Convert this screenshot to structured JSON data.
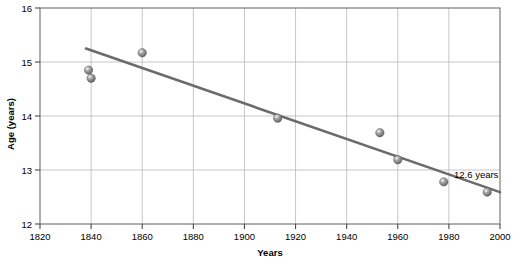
{
  "chart_data": {
    "type": "scatter",
    "title": "",
    "subtitle": "",
    "xlabel": "Years",
    "ylabel": "Age (years)",
    "xlim": [
      1820,
      2000
    ],
    "ylim": [
      12,
      16
    ],
    "xticks": [
      1820,
      1840,
      1860,
      1880,
      1900,
      1920,
      1940,
      1960,
      1980,
      2000
    ],
    "yticks": [
      12,
      13,
      14,
      15,
      16
    ],
    "xtick_labels": [
      "1820",
      "1840",
      "1860",
      "1880",
      "1900",
      "1920",
      "1940",
      "1960",
      "1980",
      "2000"
    ],
    "ytick_labels": [
      "12",
      "13",
      "14",
      "15",
      "16"
    ],
    "grid": true,
    "grid_axis": "both",
    "legend": false,
    "legend_position": "none",
    "series": [
      {
        "name": "Age at menarche",
        "type": "scatter",
        "marker": "sphere",
        "color": "#8a8a8a",
        "points": [
          {
            "x": 1839,
            "y": 14.85
          },
          {
            "x": 1840,
            "y": 14.7
          },
          {
            "x": 1860,
            "y": 15.17
          },
          {
            "x": 1913,
            "y": 13.96
          },
          {
            "x": 1953,
            "y": 13.69
          },
          {
            "x": 1960,
            "y": 13.19
          },
          {
            "x": 1978,
            "y": 12.78
          },
          {
            "x": 1995,
            "y": 12.59
          }
        ]
      },
      {
        "name": "Trend line",
        "type": "line",
        "color": "#6b6b6b",
        "points": [
          {
            "x": 1838,
            "y": 15.25
          },
          {
            "x": 2000,
            "y": 12.59
          }
        ]
      }
    ],
    "annotations": [
      {
        "text": "12.6 years",
        "x": 1982,
        "y": 12.86,
        "anchor": "start"
      }
    ]
  },
  "axes": {
    "x_title": "Years",
    "y_title": "Age (years)"
  }
}
